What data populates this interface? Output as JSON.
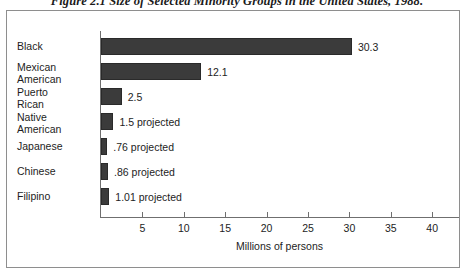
{
  "figure": {
    "caption": "Figure 2.1  Size of Selected Minority Groups in the United States, 1988."
  },
  "chart_data": {
    "type": "bar",
    "orientation": "horizontal",
    "title": "Figure 2.1  Size of Selected Minority Groups in the United States, 1988.",
    "xlabel": "Millions of persons",
    "ylabel": "",
    "xlim": [
      0,
      41
    ],
    "xticks": [
      5,
      10,
      15,
      20,
      25,
      30,
      35,
      40
    ],
    "grid": false,
    "legend": false,
    "bar_color": "#3b3b3b",
    "categories": [
      "Black",
      "Mexican American",
      "Puerto Rican",
      "Native American",
      "Japanese",
      "Chinese",
      "Filipino"
    ],
    "values": [
      30.3,
      12.1,
      2.5,
      1.5,
      0.76,
      0.86,
      1.01
    ],
    "bars": [
      {
        "category": "Black",
        "label_line1": "Black",
        "label_line2": "",
        "value": 30.3,
        "value_label": "30.3",
        "projected": false
      },
      {
        "category": "Mexican American",
        "label_line1": "Mexican",
        "label_line2": "American",
        "value": 12.1,
        "value_label": "12.1",
        "projected": false
      },
      {
        "category": "Puerto Rican",
        "label_line1": "Puerto",
        "label_line2": "Rican",
        "value": 2.5,
        "value_label": "2.5",
        "projected": false
      },
      {
        "category": "Native American",
        "label_line1": "Native",
        "label_line2": "American",
        "value": 1.5,
        "value_label": "1.5 projected",
        "projected": true
      },
      {
        "category": "Japanese",
        "label_line1": "Japanese",
        "label_line2": "",
        "value": 0.76,
        "value_label": ".76 projected",
        "projected": true
      },
      {
        "category": "Chinese",
        "label_line1": "Chinese",
        "label_line2": "",
        "value": 0.86,
        "value_label": ".86 projected",
        "projected": true
      },
      {
        "category": "Filipino",
        "label_line1": "Filipino",
        "label_line2": "",
        "value": 1.01,
        "value_label": "1.01 projected",
        "projected": true
      }
    ]
  }
}
